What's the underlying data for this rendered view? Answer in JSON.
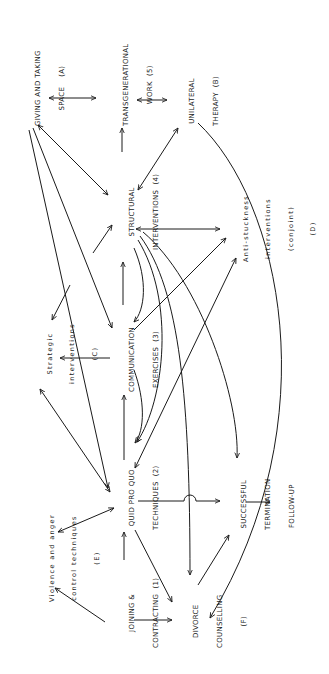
{
  "diagram": {
    "type": "flow-diagram",
    "orientation": "rotated-90-ccw",
    "nodes": [
      {
        "id": "giving",
        "lines": [
          "GIVING AND TAKING",
          "SPACE    (A)"
        ]
      },
      {
        "id": "transgen",
        "lines": [
          "TRANSGENERATIONAL",
          "WORK  (5)"
        ]
      },
      {
        "id": "unilateral",
        "lines": [
          "UNILATERAL",
          "THERAPY  (B)"
        ]
      },
      {
        "id": "structural",
        "lines": [
          "STRUCTURAL",
          "INTERVENTIONS  (4)"
        ]
      },
      {
        "id": "antistuck",
        "lines": [
          "Anti-stuckness",
          "interventions",
          "(conjoint)",
          "(D)"
        ]
      },
      {
        "id": "strategic",
        "lines": [
          "Strategic",
          "interventions",
          "(C)"
        ]
      },
      {
        "id": "communication",
        "lines": [
          "COMMUNICATION",
          "EXERCISES  (3)"
        ]
      },
      {
        "id": "violence",
        "lines": [
          "Violence and anger",
          "control techniques",
          "(E)"
        ]
      },
      {
        "id": "quidproquo",
        "lines": [
          "QUID PRO QUO",
          "TECHNIQUES  (2)"
        ]
      },
      {
        "id": "successful",
        "lines": [
          "SUCCESSFUL",
          "TERMINATION"
        ]
      },
      {
        "id": "followup",
        "lines": [
          "FOLLOW-UP"
        ]
      },
      {
        "id": "joining",
        "lines": [
          "JOINING &",
          "CONTRACTING  (1)"
        ]
      },
      {
        "id": "divorce",
        "lines": [
          "DIVORCE",
          "COUNSELLING",
          "(F)"
        ]
      }
    ],
    "edges": [
      {
        "from": "giving",
        "to": "transgen",
        "type": "bidirectional"
      },
      {
        "from": "transgen",
        "to": "unilateral",
        "type": "bidirectional"
      },
      {
        "from": "structural",
        "to": "transgen",
        "type": "directed"
      },
      {
        "from": "giving",
        "to": "structural",
        "type": "bidirectional"
      },
      {
        "from": "unilateral",
        "to": "structural",
        "type": "bidirectional"
      },
      {
        "from": "structural",
        "to": "antistuck",
        "type": "bidirectional"
      },
      {
        "from": "communication",
        "to": "structural",
        "type": "directed"
      },
      {
        "from": "communication",
        "to": "strategic",
        "type": "directed"
      },
      {
        "from": "giving",
        "to": "communication",
        "type": "bidirectional"
      },
      {
        "from": "giving",
        "to": "quidproquo",
        "type": "directed"
      },
      {
        "from": "strategic",
        "to": "quidproquo",
        "type": "bidirectional"
      },
      {
        "from": "quidproquo",
        "to": "communication",
        "type": "directed"
      },
      {
        "from": "quidproquo",
        "to": "violence",
        "type": "bidirectional"
      },
      {
        "from": "quidproquo",
        "to": "successful",
        "type": "directed"
      },
      {
        "from": "quidproquo",
        "to": "divorce",
        "type": "directed"
      },
      {
        "from": "joining",
        "to": "quidproquo",
        "type": "directed"
      },
      {
        "from": "joining",
        "to": "violence",
        "type": "directed"
      },
      {
        "from": "joining",
        "to": "divorce",
        "type": "directed"
      },
      {
        "from": "successful",
        "to": "followup",
        "type": "directed"
      },
      {
        "from": "divorce",
        "to": "successful",
        "type": "directed"
      },
      {
        "from": "structural",
        "to": "divorce",
        "type": "directed"
      },
      {
        "from": "structural",
        "to": "successful",
        "type": "directed"
      },
      {
        "from": "structural",
        "to": "quidproquo",
        "type": "directed"
      },
      {
        "from": "antistuck",
        "to": "quidproquo",
        "type": "directed"
      },
      {
        "from": "unilateral",
        "to": "divorce",
        "type": "directed"
      }
    ]
  }
}
